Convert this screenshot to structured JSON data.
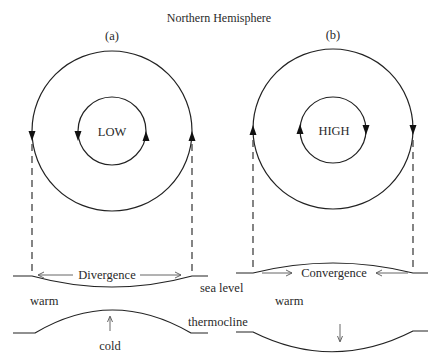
{
  "title": "Northern Hemisphere",
  "panels": [
    {
      "id": "a",
      "label": "(a)",
      "center_label": "LOW",
      "rotation": "counterclockwise",
      "flow_label": "Divergence",
      "upper_layer_label": "warm",
      "lower_layer_label": "cold",
      "sea_surface_shape": "depressed",
      "thermocline_shape": "raised"
    },
    {
      "id": "b",
      "label": "(b)",
      "center_label": "HIGH",
      "rotation": "clockwise",
      "flow_label": "Convergence",
      "upper_layer_label": "warm",
      "sea_surface_shape": "raised",
      "thermocline_shape": "depressed"
    }
  ],
  "surface_labels": {
    "sea_level": "sea level",
    "thermocline": "thermocline"
  },
  "colors": {
    "line": "#222222",
    "text": "#2a2a2a",
    "background": "#ffffff"
  }
}
